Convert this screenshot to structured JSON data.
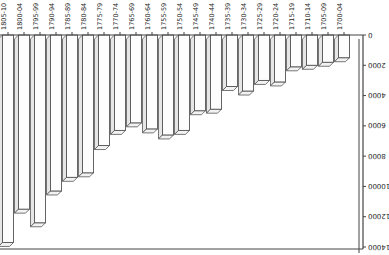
{
  "chart_data": {
    "type": "bar",
    "style": "3d-column",
    "orientation_note": "image rendered rotated 180 degrees",
    "title": "",
    "xlabel": "",
    "ylabel": "",
    "ylim": [
      0,
      14000
    ],
    "yticks": [
      0,
      2000,
      4000,
      6000,
      8000,
      10000,
      12000,
      14000
    ],
    "ytick_labels": [
      "0",
      "2000",
      "4000",
      "6000",
      "8000",
      "10000",
      "12000",
      "14000"
    ],
    "grid": false,
    "legend": null,
    "categories": [
      "1700-04",
      "1705-09",
      "1710-14",
      "1715-19",
      "1720-24",
      "1725-29",
      "1730-34",
      "1735-39",
      "1740-44",
      "1745-49",
      "1750-54",
      "1755-59",
      "1760-64",
      "1765-69",
      "1770-74",
      "1775-79",
      "1780-84",
      "1785-89",
      "1790-94",
      "1795-99",
      "1800-04",
      "1805-10"
    ],
    "values": [
      1500,
      1800,
      2000,
      2100,
      3100,
      3000,
      3700,
      3400,
      4900,
      5000,
      6300,
      6600,
      6200,
      5800,
      6300,
      7300,
      9100,
      9400,
      10300,
      12400,
      11500,
      13700
    ]
  }
}
